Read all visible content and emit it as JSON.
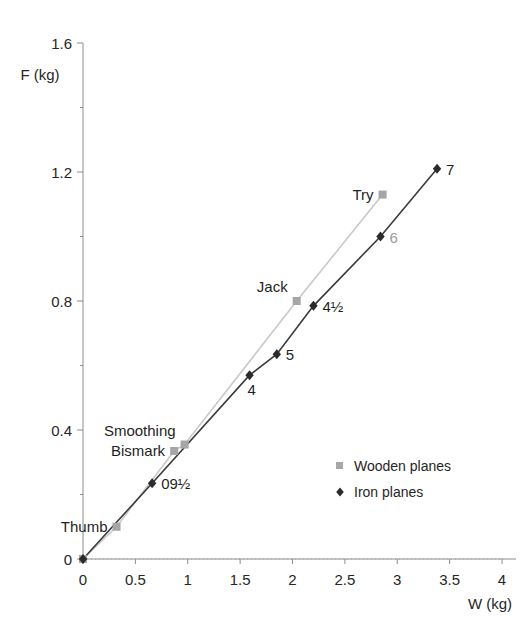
{
  "chart_data": {
    "type": "scatter",
    "title": "",
    "xlabel": "W (kg)",
    "ylabel": "F (kg)",
    "xlim": [
      0,
      4
    ],
    "ylim": [
      0,
      1.6
    ],
    "xticks": [
      "0",
      "0.5",
      "1",
      "1.5",
      "2",
      "2.5",
      "3",
      "3.5",
      "4"
    ],
    "xtick_values": [
      0,
      0.5,
      1,
      1.5,
      2,
      2.5,
      3,
      3.5,
      4
    ],
    "yticks": [
      "0",
      "0.4",
      "0.8",
      "1.2",
      "1.6"
    ],
    "ytick_values": [
      0,
      0.4,
      0.8,
      1.2,
      1.6
    ],
    "yminor_values": [
      0.2,
      0.6,
      1.0,
      1.4
    ],
    "grid": false,
    "legend_position": "center-right",
    "series": [
      {
        "name": "Wooden planes",
        "marker": "square",
        "color": "#a6a6a6",
        "line_color": "#c9c9c9",
        "points": [
          {
            "label": "",
            "x": 0.0,
            "y": 0.0
          },
          {
            "label": "Thumb",
            "x": 0.32,
            "y": 0.1,
            "label_pos": "left"
          },
          {
            "label": "Bismark",
            "x": 0.87,
            "y": 0.335,
            "label_pos": "left"
          },
          {
            "label": "Smoothing",
            "x": 0.97,
            "y": 0.355,
            "label_pos": "upper-left"
          },
          {
            "label": "Jack",
            "x": 2.04,
            "y": 0.8,
            "label_pos": "upper-left"
          },
          {
            "label": "Try",
            "x": 2.86,
            "y": 1.13,
            "label_pos": "left"
          }
        ]
      },
      {
        "name": "Iron planes",
        "marker": "diamond",
        "color": "#2b2b2b",
        "line_color": "#3a3a3a",
        "points": [
          {
            "label": "",
            "x": 0.0,
            "y": 0.0
          },
          {
            "label": "09½",
            "x": 0.66,
            "y": 0.235,
            "label_pos": "right"
          },
          {
            "label": "4",
            "x": 1.59,
            "y": 0.57,
            "label_pos": "below-right"
          },
          {
            "label": "5",
            "x": 1.85,
            "y": 0.635,
            "label_pos": "right"
          },
          {
            "label": "4½",
            "x": 2.2,
            "y": 0.785,
            "label_pos": "right"
          },
          {
            "label": "6",
            "x": 2.84,
            "y": 1.0,
            "label_pos": "right",
            "label_color": "grey"
          },
          {
            "label": "7",
            "x": 3.38,
            "y": 1.21,
            "label_pos": "right"
          }
        ]
      }
    ]
  },
  "legend": {
    "items": [
      {
        "label": "Wooden planes",
        "marker": "square",
        "color": "#a6a6a6"
      },
      {
        "label": "Iron planes",
        "marker": "diamond",
        "color": "#2b2b2b"
      }
    ]
  },
  "axes": {
    "x_title": "W (kg)",
    "y_title": "F (kg)"
  }
}
